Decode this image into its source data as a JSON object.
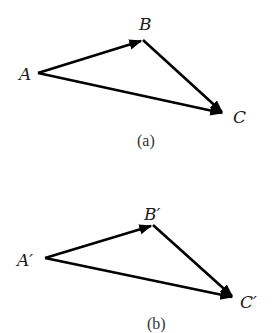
{
  "figure_a": {
    "caption": "(a)",
    "labels": {
      "A": "A",
      "B": "B",
      "C": "C"
    },
    "vectors": [
      {
        "name": "A-to-B",
        "from": "A",
        "to": "B"
      },
      {
        "name": "B-to-C",
        "from": "B",
        "to": "C"
      },
      {
        "name": "A-to-C",
        "from": "A",
        "to": "C"
      }
    ]
  },
  "figure_b": {
    "caption": "(b)",
    "labels": {
      "A": "A′",
      "B": "B′",
      "C": "C′"
    },
    "vectors": [
      {
        "name": "A'-to-B'",
        "from": "A′",
        "to": "B′"
      },
      {
        "name": "B'-to-C'",
        "from": "B′",
        "to": "C′"
      },
      {
        "name": "A'-to-C'",
        "from": "A′",
        "to": "C′"
      }
    ]
  },
  "colors": {
    "stroke": "#000000",
    "label": "#1a1a1a",
    "background": "#ffffff"
  }
}
